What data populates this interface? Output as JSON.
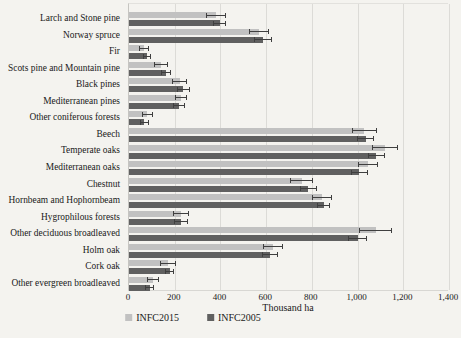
{
  "chart_data": {
    "type": "bar",
    "orientation": "horizontal",
    "title": "",
    "xlabel": "Thousand ha",
    "xlim": [
      0,
      1400
    ],
    "grid": true,
    "legend_position": "bottom",
    "error_bars": true,
    "xticks": [
      {
        "value": 0,
        "label": "0"
      },
      {
        "value": 200,
        "label": "200"
      },
      {
        "value": 400,
        "label": "400"
      },
      {
        "value": 600,
        "label": "600"
      },
      {
        "value": 800,
        "label": "800"
      },
      {
        "value": 1000,
        "label": "1,000"
      },
      {
        "value": 1200,
        "label": "1,200"
      },
      {
        "value": 1400,
        "label": "1,400"
      }
    ],
    "categories": [
      "Larch and Stone pine",
      "Norway spruce",
      "Fir",
      "Scots pine and Mountain pine",
      "Black pines",
      "Mediterranean pines",
      "Other coniferous forests",
      "Beech",
      "Temperate oaks",
      "Mediterranean oaks",
      "Chestnut",
      "Hornbeam and Hophornbeam",
      "Hygrophilous forests",
      "Other deciduous broadleaved",
      "Holm oak",
      "Cork oak",
      "Other evergreen broadleaved"
    ],
    "series": [
      {
        "name": "INFC2015",
        "color": "#c1c1c1",
        "values": [
          380,
          570,
          65,
          140,
          222,
          228,
          80,
          1030,
          1120,
          1045,
          755,
          845,
          228,
          1080,
          630,
          170,
          105
        ],
        "errors": [
          45,
          43,
          22,
          30,
          32,
          26,
          25,
          55,
          58,
          45,
          50,
          44,
          34,
          72,
          44,
          35,
          28
        ]
      },
      {
        "name": "INFC2005",
        "color": "#606060",
        "values": [
          396,
          585,
          80,
          163,
          237,
          220,
          66,
          1036,
          1082,
          1007,
          785,
          852,
          226,
          1000,
          615,
          178,
          90
        ],
        "errors": [
          28,
          40,
          17,
          22,
          28,
          26,
          20,
          38,
          36,
          37,
          37,
          29,
          31,
          43,
          35,
          21,
          21
        ]
      }
    ],
    "colors": {
      "background": "#f4f3ef",
      "gridline": "#dcdbd7",
      "axis": "#c6c5c1",
      "error_bar": "#3f3f3f",
      "text": "#1a1a1a"
    }
  }
}
